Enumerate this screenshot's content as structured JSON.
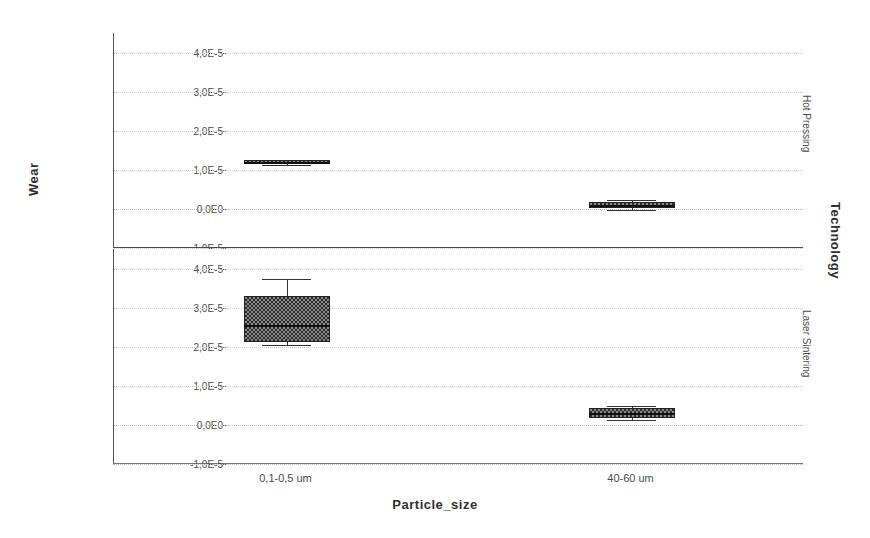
{
  "axes": {
    "y_title": "Wear",
    "x_title": "Particle_size",
    "facet_var_title": "Technology"
  },
  "facets": [
    {
      "id": "hot",
      "label": "Hot Pressing"
    },
    {
      "id": "laser",
      "label": "Laser Sintering"
    }
  ],
  "y_ticks": [
    {
      "label": "4,0E-5",
      "value": 4e-05
    },
    {
      "label": "3,0E-5",
      "value": 3e-05
    },
    {
      "label": "2,0E-5",
      "value": 2e-05
    },
    {
      "label": "1,0E-5",
      "value": 1e-05
    },
    {
      "label": "0,0E0",
      "value": 0.0
    },
    {
      "label": "-1,0E-5",
      "value": -1e-05
    }
  ],
  "x_categories": [
    {
      "label": "0,1-0,5 um"
    },
    {
      "label": "40-60 um"
    }
  ],
  "colors": {
    "box_fill": "#8a8a8a",
    "box_hatch": "#2b2b2b",
    "box_stroke": "#222222",
    "grid": "#c9c9c9",
    "axis": "#555555",
    "text": "#4a4a4a"
  },
  "chart_data": {
    "type": "box",
    "title": "",
    "xlabel": "Particle_size",
    "ylabel": "Wear",
    "facet_by": "Technology",
    "grid": true,
    "legend": "none",
    "ylim": [
      -1e-05,
      4.5e-05
    ],
    "ytick_values": [
      -1e-05,
      0.0,
      1e-05,
      2e-05,
      3e-05,
      4e-05
    ],
    "ytick_labels": [
      "-1,0E-5",
      "0,0E0",
      "1,0E-5",
      "2,0E-5",
      "3,0E-5",
      "4,0E-5"
    ],
    "categories": [
      "0,1-0,5 um",
      "40-60 um"
    ],
    "panels": [
      {
        "name": "Hot Pressing",
        "boxes": [
          {
            "category": "0,1-0,5 um",
            "whisker_low": 1.13e-05,
            "q1": 1.15e-05,
            "median": 1.2e-05,
            "q3": 1.24e-05,
            "whisker_high": 1.26e-05
          },
          {
            "category": "40-60 um",
            "whisker_low": -4e-07,
            "q1": 2e-07,
            "median": 1e-06,
            "q3": 1.8e-06,
            "whisker_high": 2.2e-06
          }
        ]
      },
      {
        "name": "Laser Sintering",
        "boxes": [
          {
            "category": "0,1-0,5 um",
            "whisker_low": 2.05e-05,
            "q1": 2.12e-05,
            "median": 2.55e-05,
            "q3": 3.3e-05,
            "whisker_high": 3.72e-05
          },
          {
            "category": "40-60 um",
            "whisker_low": 1.2e-06,
            "q1": 1.8e-06,
            "median": 3e-06,
            "q3": 4.2e-06,
            "whisker_high": 4.8e-06
          }
        ]
      }
    ]
  }
}
